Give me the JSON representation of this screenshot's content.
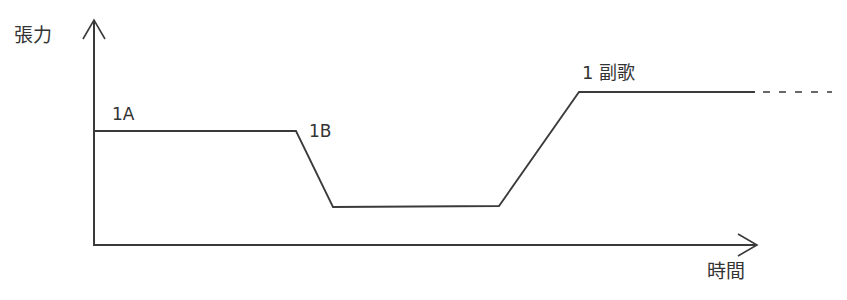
{
  "axes": {
    "y_label": "張力",
    "x_label": "時間"
  },
  "segments": [
    {
      "label": "1A"
    },
    {
      "label": "1B"
    },
    {
      "label": "1 副歌"
    }
  ],
  "colors": {
    "line": "#3a3a3a",
    "text": "#333333",
    "background": "#ffffff"
  }
}
